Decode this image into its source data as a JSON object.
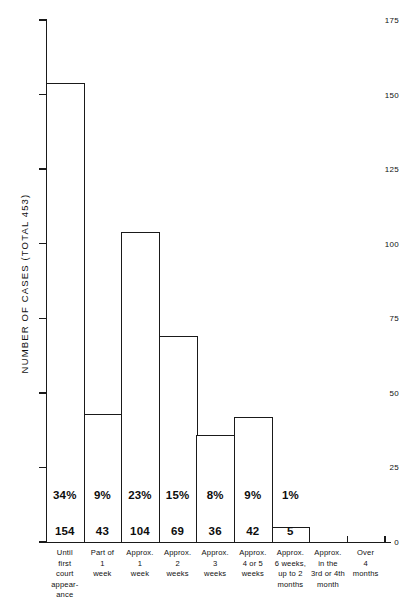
{
  "chart_data": {
    "type": "bar",
    "title": "",
    "subtitle": "",
    "xlabel": "",
    "ylabel": "NUMBER OF CASES  (TOTAL 453)",
    "ylim": [
      0,
      175
    ],
    "y_ticks": [
      0,
      25,
      50,
      75,
      100,
      125,
      150,
      175
    ],
    "y_tick_labels": [
      "0",
      "25",
      "50",
      "75",
      "100",
      "125",
      "150",
      "175"
    ],
    "grid": false,
    "legend": null,
    "total_cases": 453,
    "categories": [
      "Until first court appear- ance",
      "Part of 1 week",
      "Approx. 1 week",
      "Approx. 2 weeks",
      "Approx. 3 weeks",
      "Approx. 4 or 5 weeks",
      "Approx. 6 weeks, up to 2 months",
      "Approx. in the 3rd or 4th month",
      "Over 4 months"
    ],
    "category_lines": [
      [
        "Until",
        "first",
        "court",
        "appear-",
        "ance"
      ],
      [
        "Part of",
        "1",
        "week"
      ],
      [
        "Approx.",
        "1",
        "week"
      ],
      [
        "Approx.",
        "2",
        "weeks"
      ],
      [
        "Approx.",
        "3",
        "weeks"
      ],
      [
        "Approx.",
        "4 or 5",
        "weeks"
      ],
      [
        "Approx.",
        "6 weeks,",
        "up to 2",
        "months"
      ],
      [
        "Approx.",
        "in the",
        "3rd or 4th",
        "month"
      ],
      [
        "Over",
        "4",
        "months"
      ]
    ],
    "values": [
      154,
      43,
      104,
      69,
      36,
      42,
      5,
      0,
      0
    ],
    "value_labels": [
      "154",
      "43",
      "104",
      "69",
      "36",
      "42",
      "5",
      "",
      ""
    ],
    "percent_labels": [
      "34%",
      "9%",
      "23%",
      "15%",
      "8%",
      "9%",
      "1%",
      "",
      ""
    ],
    "bar_color": "#ffffff",
    "bar_edge_color": "#1a1a1a",
    "axis_color": "#1a1a1a",
    "text_color": "#111111"
  }
}
